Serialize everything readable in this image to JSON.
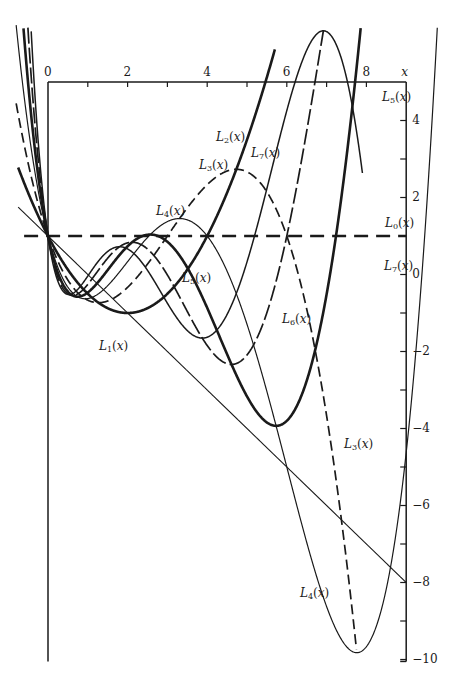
{
  "chart_data": {
    "type": "line",
    "title": "",
    "xlabel": "x",
    "ylabel": "",
    "xlim": [
      0,
      9
    ],
    "ylim": [
      -10,
      5
    ],
    "grid": false,
    "legend": "inline labels",
    "x_ticks": [
      0,
      2,
      4,
      6,
      8
    ],
    "x_minor_ticks": [
      1,
      3,
      5,
      7
    ],
    "y_ticks": [
      4,
      2,
      0,
      -2,
      -4,
      -6,
      -8,
      -10
    ],
    "y_minor_ticks": [
      3,
      1,
      -1,
      -3,
      -5,
      -7,
      -9
    ],
    "x_tick_labels": [
      "0",
      "2",
      "4",
      "6",
      "8"
    ],
    "y_tick_labels": [
      "4",
      "2",
      "0",
      "−2",
      "−4",
      "−6",
      "−8",
      "−10"
    ],
    "series": [
      {
        "name": "L0(x)",
        "n": 0,
        "style": "dashed",
        "width": 2.4,
        "xrange": [
          -0.6,
          9.0
        ],
        "key_points": [
          [
            0,
            1
          ],
          [
            9,
            1
          ]
        ]
      },
      {
        "name": "L1(x)",
        "n": 1,
        "style": "solid",
        "width": 1.1,
        "xrange": [
          -0.75,
          9.0
        ],
        "key_points": [
          [
            0,
            1
          ],
          [
            1,
            0
          ],
          [
            9,
            -8
          ]
        ]
      },
      {
        "name": "L2(x)",
        "n": 2,
        "style": "solid",
        "width": 2.6,
        "xrange": [
          -0.75,
          5.7
        ],
        "key_points": [
          [
            0,
            1
          ],
          [
            2,
            -1
          ],
          [
            5.6,
            5.5
          ]
        ]
      },
      {
        "name": "L3(x)",
        "n": 3,
        "style": "dashed",
        "width": 1.7,
        "xrange": [
          -0.8,
          7.75
        ],
        "key_points": [
          [
            0,
            1
          ],
          [
            1.0,
            -0.6
          ],
          [
            4.6,
            2.7
          ],
          [
            7.7,
            -10
          ]
        ]
      },
      {
        "name": "L4(x)",
        "n": 4,
        "style": "solid",
        "width": 1.2,
        "xrange": [
          -0.8,
          9.9
        ],
        "key_points": [
          [
            0,
            1
          ],
          [
            0.8,
            -0.5
          ],
          [
            3.3,
            1.5
          ],
          [
            7.7,
            -10
          ],
          [
            9.8,
            6
          ]
        ]
      },
      {
        "name": "L5(x)",
        "n": 5,
        "style": "solid",
        "width": 2.6,
        "xrange": [
          -0.8,
          8.95
        ],
        "key_points": [
          [
            0,
            1
          ],
          [
            0.7,
            -0.4
          ],
          [
            2.6,
            0.9
          ],
          [
            5.7,
            -3.9
          ],
          [
            7.0,
            6.3
          ],
          [
            8.9,
            -10
          ]
        ]
      },
      {
        "name": "L6(x)",
        "n": 6,
        "style": "longdash",
        "width": 1.7,
        "xrange": [
          -0.8,
          7.5
        ],
        "key_points": [
          [
            0,
            1
          ],
          [
            0.6,
            -0.3
          ],
          [
            2.2,
            0.8
          ],
          [
            4.7,
            -2.3
          ],
          [
            7.4,
            5.9
          ]
        ]
      },
      {
        "name": "L7(x)",
        "n": 7,
        "style": "solid",
        "width": 1.5,
        "xrange": [
          -0.85,
          7.9
        ],
        "key_points": [
          [
            0,
            1
          ],
          [
            1.9,
            0.8
          ],
          [
            4.0,
            -1.5
          ],
          [
            7.8,
            5.8
          ]
        ]
      }
    ],
    "labels": [
      {
        "text": "L",
        "sub": "2",
        "x": 216,
        "y": 131
      },
      {
        "text": "L",
        "sub": "7",
        "x": 251,
        "y": 147
      },
      {
        "text": "L",
        "sub": "3",
        "x": 199,
        "y": 159
      },
      {
        "text": "L",
        "sub": "4",
        "x": 156,
        "y": 205
      },
      {
        "text": "L",
        "sub": "5",
        "x": 382,
        "y": 91
      },
      {
        "text": "L",
        "sub": "0",
        "x": 385,
        "y": 217
      },
      {
        "text": "L",
        "sub": "7",
        "x": 384,
        "y": 260
      },
      {
        "text": "L",
        "sub": "5",
        "x": 182,
        "y": 272
      },
      {
        "text": "L",
        "sub": "6",
        "x": 282,
        "y": 313
      },
      {
        "text": "L",
        "sub": "1",
        "x": 99,
        "y": 340
      },
      {
        "text": "L",
        "sub": "3",
        "x": 344,
        "y": 438
      },
      {
        "text": "L",
        "sub": "4",
        "x": 300,
        "y": 587
      }
    ]
  }
}
